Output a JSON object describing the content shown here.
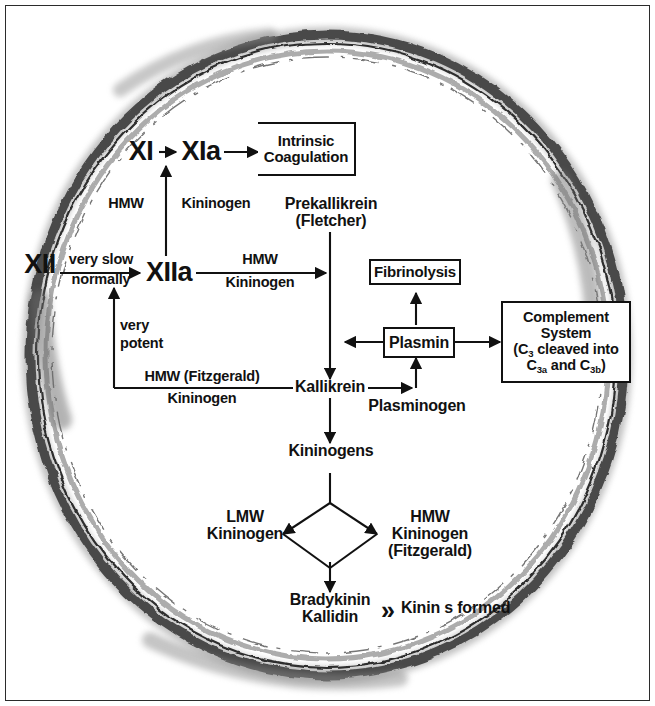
{
  "diagram": {
    "colors": {
      "ink": "#111111",
      "frame": "#2b2b2b",
      "vessel_dark": "#3a3a3a",
      "vessel_mid": "#7d7d7d",
      "vessel_light": "#bcbcbc",
      "background": "#ffffff"
    },
    "nodes": {
      "factor_xi": "XI",
      "factor_xia": "XIa",
      "factor_xii": "XII",
      "factor_xiia": "XIIa",
      "prekallikrein": "Prekallikrein",
      "prekallikrein_alt": "(Fletcher)",
      "kallikrein": "Kallikrein",
      "plasminogen": "Plasminogen",
      "kininogens": "Kininogens",
      "lmw_kininogen_l1": "LMW",
      "lmw_kininogen_l2": "Kininogen",
      "hmw_kininogen_l1": "HMW",
      "hmw_kininogen_l2": "Kininogen",
      "hmw_kininogen_l3": "(Fitzgerald)",
      "bradykinin": "Bradykinin",
      "kallidin": "Kallidin",
      "kinins_formed": "Kinin s formed",
      "kinins_marker": "»"
    },
    "boxes": {
      "intrinsic_coagulation_l1": "Intrinsic",
      "intrinsic_coagulation_l2": "Coagulation",
      "fibrinolysis": "Fibrinolysis",
      "plasmin": "Plasmin",
      "complement_l1": "Complement",
      "complement_l2": "System",
      "complement_l3_pre": "(C",
      "complement_l3_sub": "3",
      "complement_l3_post": " cleaved into",
      "complement_l4_c1": "C",
      "complement_l4_c1sub": "3a",
      "complement_l4_mid": " and C",
      "complement_l4_c2sub": "3b",
      "complement_l4_end": ")"
    },
    "edge_labels": {
      "xiia_to_xi_l1": "HMW",
      "xiia_to_xi_l2": "Kininogen",
      "xii_to_xiia_l1": "very slow",
      "xii_to_xiia_l2": "normally",
      "xiia_to_prekallikrein_l1": "HMW",
      "xiia_to_prekallikrein_l2": "Kininogen",
      "feedback_l1": "very",
      "feedback_l2": "potent",
      "kallikrein_feedback_l1": "HMW (Fitzgerald)",
      "kallikrein_feedback_l2": "Kininogen"
    }
  }
}
